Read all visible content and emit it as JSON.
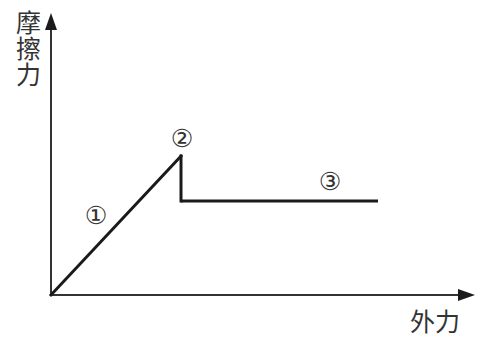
{
  "diagram": {
    "type": "friction-force-vs-applied-force",
    "y_axis_label": "摩擦力",
    "x_axis_label": "外力",
    "markers": [
      {
        "id": "1",
        "label": "①",
        "x": 96,
        "y": 215
      },
      {
        "id": "2",
        "label": "②",
        "x": 182,
        "y": 138
      },
      {
        "id": "3",
        "label": "③",
        "x": 330,
        "y": 181
      }
    ],
    "colors": {
      "line": "#1a1a1a",
      "axis": "#333333",
      "text": "#333333",
      "background": "#ffffff"
    },
    "geometry": {
      "origin": [
        51,
        295
      ],
      "y_axis_top": [
        51,
        14
      ],
      "x_axis_end": [
        474,
        295
      ],
      "static_peak": [
        181,
        156
      ],
      "drop_bottom": [
        181,
        201
      ],
      "kinetic_end": [
        378,
        201
      ]
    }
  }
}
